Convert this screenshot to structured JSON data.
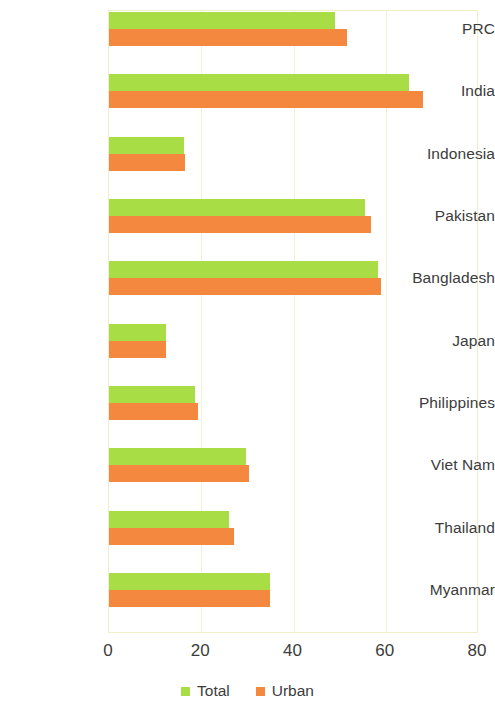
{
  "chart_data": {
    "type": "bar",
    "orientation": "horizontal",
    "title": "",
    "xlabel": "",
    "ylabel": "",
    "xlim": [
      0,
      80
    ],
    "xticks": [
      "0",
      "20",
      "40",
      "60",
      "80"
    ],
    "grid": true,
    "legend_position": "bottom",
    "categories": [
      "PRC",
      "India",
      "Indonesia",
      "Pakistan",
      "Bangladesh",
      "Japan",
      "Philippines",
      "Viet Nam",
      "Thailand",
      "Myanmar"
    ],
    "series": [
      {
        "name": "Total",
        "color": "#a9dd45",
        "values": [
          49.0,
          65.0,
          16.3,
          55.5,
          58.3,
          12.3,
          18.7,
          29.6,
          26.0,
          34.8
        ]
      },
      {
        "name": "Urban",
        "color": "#f5883f",
        "values": [
          51.5,
          68.0,
          16.5,
          56.7,
          59.0,
          12.3,
          19.3,
          30.4,
          27.0,
          34.8
        ]
      }
    ]
  },
  "legend": {
    "items": [
      {
        "label": "Total",
        "color": "#a9dd45"
      },
      {
        "label": "Urban",
        "color": "#f5883f"
      }
    ]
  },
  "colors": {
    "total": "#a9dd45",
    "urban": "#f5883f",
    "grid": "#f3f1d2",
    "frame": "#f0eec8",
    "text": "#3c3c3c",
    "background": "#ffffff"
  }
}
